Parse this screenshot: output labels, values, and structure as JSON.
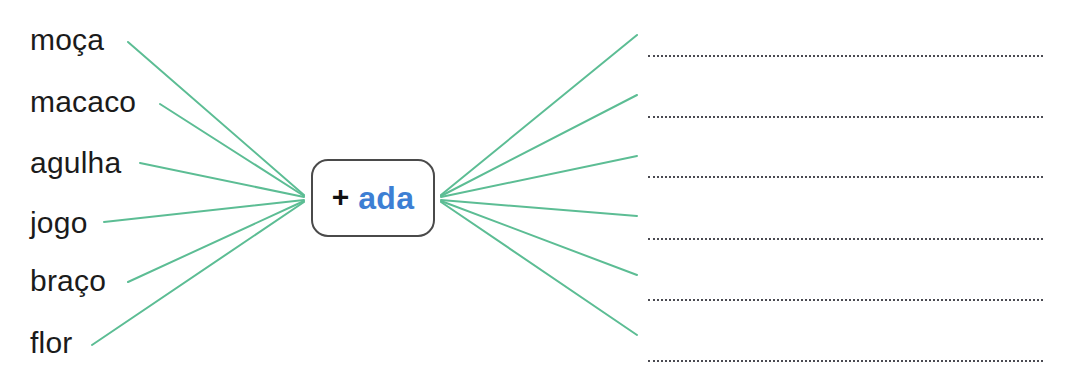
{
  "worksheet": {
    "title": "Word formation exercise: add suffix -ada",
    "background_color": "#ffffff",
    "width": 1075,
    "height": 381
  },
  "stem": {
    "plus_sign": "+",
    "suffix": "ada",
    "plus_color": "#111111",
    "suffix_color": "#3d7fd4",
    "border_color": "#4a4a4a",
    "box": {
      "x": 311,
      "y": 159,
      "width": 124,
      "height": 78,
      "radius": 17
    }
  },
  "connectors": {
    "color": "#5cbd94",
    "width": 2,
    "hub": {
      "x": 306,
      "y": 198
    },
    "left": [
      {
        "name": "connector-moca",
        "x1": 128,
        "y1": 42,
        "x2": 304,
        "y2": 195
      },
      {
        "name": "connector-macaco",
        "x1": 160,
        "y1": 104,
        "x2": 304,
        "y2": 196
      },
      {
        "name": "connector-agulha",
        "x1": 140,
        "y1": 163,
        "x2": 304,
        "y2": 197
      },
      {
        "name": "connector-jogo",
        "x1": 104,
        "y1": 222,
        "x2": 304,
        "y2": 200
      },
      {
        "name": "connector-braco",
        "x1": 128,
        "y1": 282,
        "x2": 304,
        "y2": 201
      },
      {
        "name": "connector-flor",
        "x1": 92,
        "y1": 345,
        "x2": 304,
        "y2": 202
      }
    ],
    "right": [
      {
        "name": "connector-blank-1",
        "x1": 441,
        "y1": 195,
        "x2": 637,
        "y2": 35
      },
      {
        "name": "connector-blank-2",
        "x1": 441,
        "y1": 196,
        "x2": 637,
        "y2": 95
      },
      {
        "name": "connector-blank-3",
        "x1": 441,
        "y1": 197,
        "x2": 637,
        "y2": 156
      },
      {
        "name": "connector-blank-4",
        "x1": 441,
        "y1": 200,
        "x2": 637,
        "y2": 216
      },
      {
        "name": "connector-blank-5",
        "x1": 441,
        "y1": 201,
        "x2": 637,
        "y2": 275
      },
      {
        "name": "connector-blank-6",
        "x1": 441,
        "y1": 202,
        "x2": 637,
        "y2": 335
      }
    ]
  },
  "words": [
    {
      "label": "moça",
      "top": 25,
      "name": "word-moca"
    },
    {
      "label": "macaco",
      "top": 87,
      "name": "word-macaco"
    },
    {
      "label": "agulha",
      "top": 148,
      "name": "word-agulha"
    },
    {
      "label": "jogo",
      "top": 208,
      "name": "word-jogo"
    },
    {
      "label": "braço",
      "top": 266,
      "name": "word-braco"
    },
    {
      "label": "flor",
      "top": 328,
      "name": "word-flor"
    }
  ],
  "answer_lines": {
    "color": "#4b4b52",
    "left": 648,
    "width": 395,
    "style": "dotted",
    "items": [
      {
        "top": 55,
        "name": "answer-line-1"
      },
      {
        "top": 116,
        "name": "answer-line-2"
      },
      {
        "top": 176,
        "name": "answer-line-3"
      },
      {
        "top": 238,
        "name": "answer-line-4"
      },
      {
        "top": 299,
        "name": "answer-line-5"
      },
      {
        "top": 360,
        "name": "answer-line-6"
      }
    ]
  }
}
